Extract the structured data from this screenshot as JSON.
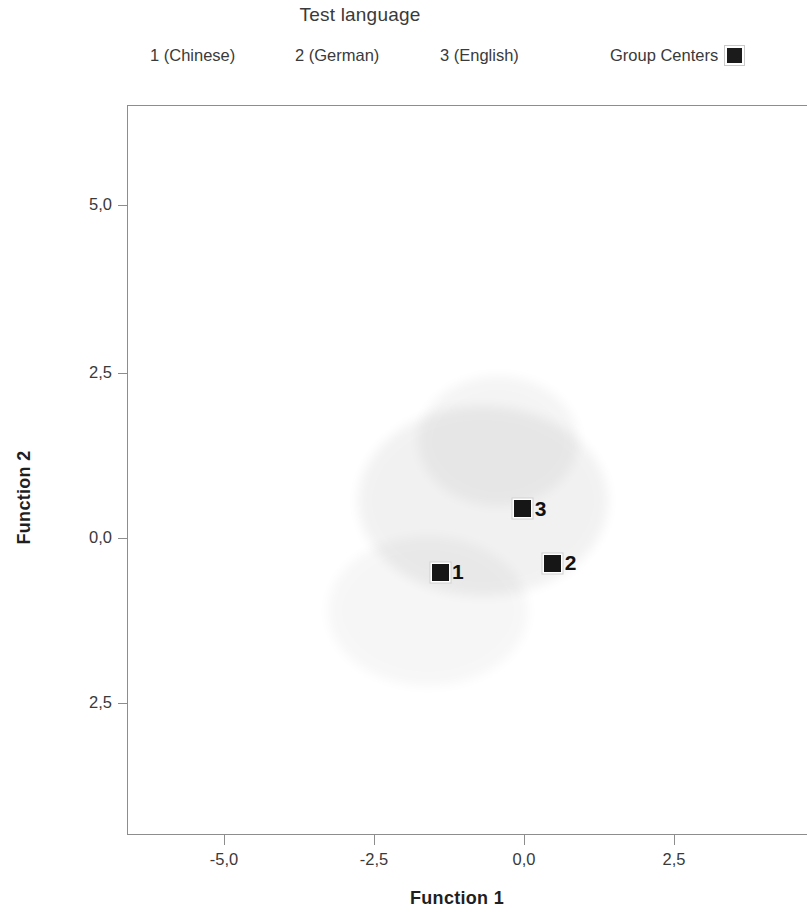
{
  "legend": {
    "title": "Test language",
    "items": [
      {
        "label": "1 (Chinese)"
      },
      {
        "label": "2 (German)"
      },
      {
        "label": "3 (English)"
      }
    ],
    "group_centers_label": "Group Centers"
  },
  "axes": {
    "x_title": "Function 1",
    "y_title": "Function 2",
    "x_ticklabels": [
      "-5,0",
      "-2,5",
      "0,0",
      "2,5"
    ],
    "y_ticklabels": [
      "5,0",
      "2,5",
      "0,0",
      "2,5"
    ]
  },
  "chart_data": {
    "type": "scatter",
    "title": "Test language",
    "xlabel": "Function 1",
    "ylabel": "Function 2",
    "xlim": [
      -6.2,
      3.3
    ],
    "ylim": [
      -4.0,
      5.9
    ],
    "xticks": [
      -5.0,
      -2.5,
      0.0,
      2.5
    ],
    "yticks": [
      5.0,
      2.5,
      0.0,
      -2.5
    ],
    "xticklabels": [
      "-5,0",
      "-2,5",
      "0,0",
      "2,5"
    ],
    "yticklabels": [
      "5,0",
      "2,5",
      "0,0",
      "2,5"
    ],
    "grid": false,
    "legend_position": "top",
    "decimal_separator": ",",
    "series": [
      {
        "name": "Group Centers",
        "marker": "filled-square",
        "color": "#161616",
        "points": [
          {
            "label": "1",
            "group": "1 (Chinese)",
            "x": -1.4,
            "y": -0.52
          },
          {
            "label": "2",
            "group": "2 (German)",
            "x": 0.48,
            "y": -0.38
          },
          {
            "label": "3",
            "group": "3 (English)",
            "x": -0.02,
            "y": 0.44
          }
        ]
      }
    ]
  }
}
